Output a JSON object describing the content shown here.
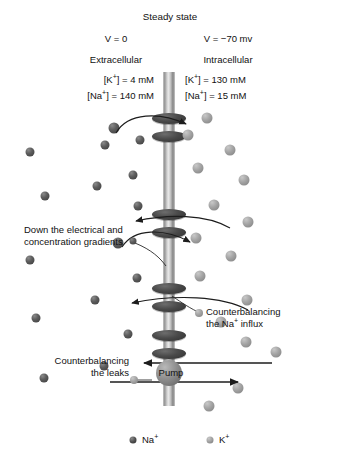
{
  "diagram": {
    "title": "Steady state",
    "voltage_left": "V = 0",
    "voltage_right": "V = −70 mv",
    "compartment_left": "Extracellular",
    "compartment_right": "Intracellular",
    "conc_left_k": "[K+] = 4 mM",
    "conc_left_na": "[Na+] = 140 mM",
    "conc_right_k": "[K+] = 130 mM",
    "conc_right_na": "[Na+] = 15 mM",
    "annotation_gradients_line1": "Down the electrical and",
    "annotation_gradients_line2": "concentration gradients",
    "annotation_influx_line1": "Counterbalancing",
    "annotation_influx_line2": "the Na+ influx",
    "annotation_leaks_line1": "Counterbalancing",
    "annotation_leaks_line2": "the leaks",
    "pump_label": "Pump"
  },
  "legend": {
    "sodium_label": "Na+",
    "potassium_label": "K+",
    "sodium_color": "#4b4b4b",
    "potassium_color": "#9c9c9c"
  },
  "colors": {
    "background": "#ffffff",
    "text": "#111111",
    "membrane": "#bdbdbd",
    "channel": "#3a3a3a",
    "pump": "#8f8f8f",
    "arrow": "#1d1d1d"
  },
  "chart_data": {
    "type": "diagram",
    "title": "Steady state",
    "compartments": [
      {
        "name": "Extracellular",
        "side": "left",
        "voltage_mv": 0,
        "voltage_text": "V = 0",
        "concentrations": [
          {
            "ion": "K+",
            "value": 4,
            "unit": "mM",
            "text": "[K+] = 4 mM"
          },
          {
            "ion": "Na+",
            "value": 140,
            "unit": "mM",
            "text": "[Na+] = 140 mM"
          }
        ]
      },
      {
        "name": "Intracellular",
        "side": "right",
        "voltage_mv": -70,
        "voltage_text": "V = −70 mv",
        "concentrations": [
          {
            "ion": "K+",
            "value": 130,
            "unit": "mM",
            "text": "[K+] = 130 mM"
          },
          {
            "ion": "Na+",
            "value": 15,
            "unit": "mM",
            "text": "[Na+] = 15 mM"
          }
        ]
      }
    ],
    "channels": [
      {
        "index": 1,
        "y": 126,
        "flux_ion": "Na+",
        "direction": "inward",
        "label": "Down the electrical and concentration gradients"
      },
      {
        "index": 2,
        "y": 223,
        "flux_ion": "K+",
        "direction": "outward",
        "label": "Down the electrical and concentration gradients"
      },
      {
        "index": 3,
        "y": 296,
        "flux_ion": "Na+",
        "direction": "inward",
        "label": "Down the electrical and concentration gradients"
      },
      {
        "index": 4,
        "y": 340,
        "flux_ion": "K+",
        "direction": "outward",
        "label": "Down the electrical and concentration gradients"
      }
    ],
    "pump": {
      "label": "Pump",
      "y": 378,
      "na_direction": "outward",
      "k_direction": "inward",
      "na_note": "Counterbalancing the Na+ influx",
      "k_note": "Counterbalancing the leaks"
    },
    "legend_entries": [
      {
        "label": "Na+",
        "color": "#4b4b4b"
      },
      {
        "label": "K+",
        "color": "#9c9c9c"
      }
    ]
  },
  "ions": {
    "extracellular_sodium": [
      {
        "x": 114,
        "y": 128,
        "r": 5.5
      },
      {
        "x": 105,
        "y": 145,
        "r": 4.5
      },
      {
        "x": 140,
        "y": 140,
        "r": 4.5
      },
      {
        "x": 30,
        "y": 152,
        "r": 4.5
      },
      {
        "x": 133,
        "y": 175,
        "r": 4.5
      },
      {
        "x": 97,
        "y": 186,
        "r": 4.5
      },
      {
        "x": 45,
        "y": 196,
        "r": 4.5
      },
      {
        "x": 138,
        "y": 206,
        "r": 4.5
      },
      {
        "x": 118,
        "y": 243,
        "r": 5.5
      },
      {
        "x": 30,
        "y": 260,
        "r": 4.5
      },
      {
        "x": 137,
        "y": 278,
        "r": 4.5
      },
      {
        "x": 95,
        "y": 300,
        "r": 4.5
      },
      {
        "x": 36,
        "y": 318,
        "r": 4.5
      },
      {
        "x": 128,
        "y": 334,
        "r": 4.5
      },
      {
        "x": 44,
        "y": 378,
        "r": 4.5
      },
      {
        "x": 104,
        "y": 366,
        "r": 4.5
      }
    ],
    "intracellular_potassium": [
      {
        "x": 207,
        "y": 118,
        "r": 5.5
      },
      {
        "x": 188,
        "y": 135,
        "r": 5.5
      },
      {
        "x": 230,
        "y": 150,
        "r": 5.5
      },
      {
        "x": 198,
        "y": 168,
        "r": 5.5
      },
      {
        "x": 244,
        "y": 180,
        "r": 5.5
      },
      {
        "x": 214,
        "y": 205,
        "r": 5.5
      },
      {
        "x": 248,
        "y": 222,
        "r": 5.5
      },
      {
        "x": 196,
        "y": 238,
        "r": 5.5
      },
      {
        "x": 231,
        "y": 256,
        "r": 5.5
      },
      {
        "x": 200,
        "y": 276,
        "r": 5.5
      },
      {
        "x": 247,
        "y": 300,
        "r": 5.5
      },
      {
        "x": 221,
        "y": 322,
        "r": 5.5
      },
      {
        "x": 276,
        "y": 352,
        "r": 5.5
      },
      {
        "x": 238,
        "y": 388,
        "r": 5.5
      },
      {
        "x": 246,
        "y": 342,
        "r": 5.5
      },
      {
        "x": 209,
        "y": 406,
        "r": 5.5
      }
    ]
  }
}
